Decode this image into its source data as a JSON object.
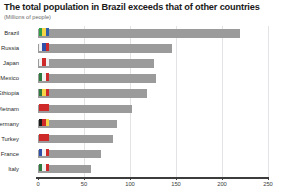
{
  "chart_data": {
    "type": "bar",
    "orientation": "horizontal",
    "title": "The total population in Brazil exceeds that of other countries",
    "subtitle": "(Millions of people)",
    "xlabel": "",
    "ylabel": "",
    "xlim": [
      0,
      250
    ],
    "xticks": [
      0,
      50,
      100,
      150,
      200,
      250
    ],
    "xtick_labels": [
      "0",
      "50",
      "100",
      "150",
      "200",
      "250"
    ],
    "grid": true,
    "grid_axis": "x",
    "legend": false,
    "bar_color": "#9b9b9b",
    "categories": [
      "Brazil",
      "Russia",
      "Japan",
      "Mexico",
      "Ethiopia",
      "Vietnam",
      "Germany",
      "Turkey",
      "France",
      "Italy"
    ],
    "values": [
      220,
      146,
      126,
      128,
      118,
      102,
      86,
      82,
      68,
      58
    ],
    "bars": [
      {
        "category": "Brazil",
        "value": 220,
        "icon": "flag-brazil-icon",
        "flag": [
          "#2f9e44",
          "#f5d547",
          "#2f5fa8"
        ]
      },
      {
        "category": "Russia",
        "value": 146,
        "icon": "flag-russia-icon",
        "flag": [
          "#f2f2f2",
          "#2f4fa8",
          "#cf2a2a"
        ]
      },
      {
        "category": "Japan",
        "value": 126,
        "icon": "flag-japan-icon",
        "flag": [
          "#f2f2f2",
          "#cf2a2a",
          "#f2f2f2"
        ]
      },
      {
        "category": "Mexico",
        "value": 128,
        "icon": "flag-mexico-icon",
        "flag": [
          "#2f7a3f",
          "#f2f2f2",
          "#cf2a2a"
        ]
      },
      {
        "category": "Ethiopia",
        "value": 118,
        "icon": "flag-ethiopia-icon",
        "flag": [
          "#2f7a3f",
          "#f5d547",
          "#cf2a2a"
        ]
      },
      {
        "category": "Vietnam",
        "value": 102,
        "icon": "flag-vietnam-icon",
        "flag": [
          "#cf2a2a",
          "#cf2a2a",
          "#cf2a2a"
        ]
      },
      {
        "category": "Germany",
        "value": 86,
        "icon": "flag-germany-icon",
        "flag": [
          "#1a1a1a",
          "#cf2a2a",
          "#f5d547"
        ]
      },
      {
        "category": "Turkey",
        "value": 82,
        "icon": "flag-turkey-icon",
        "flag": [
          "#cf2a2a",
          "#cf2a2a",
          "#cf2a2a"
        ]
      },
      {
        "category": "France",
        "value": 68,
        "icon": "flag-france-icon",
        "flag": [
          "#2f4fa8",
          "#f2f2f2",
          "#cf2a2a"
        ]
      },
      {
        "category": "Italy",
        "value": 58,
        "icon": "flag-italy-icon",
        "flag": [
          "#2f7a3f",
          "#f2f2f2",
          "#cf2a2a"
        ]
      }
    ]
  }
}
